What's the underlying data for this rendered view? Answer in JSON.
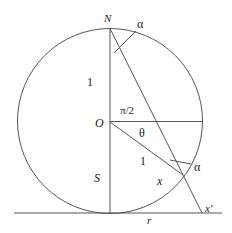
{
  "diagram": {
    "type": "stereographic projection of circle onto line",
    "labels": {
      "north": "N",
      "origin": "O",
      "south": "S",
      "radius_upper": "1",
      "radius_lower": "1",
      "right_angle": "π/2",
      "theta": "θ",
      "alpha_top": "α",
      "alpha_bottom": "α",
      "point_x": "x",
      "point_x_prime": "x'",
      "line_r": "r"
    },
    "colors": {
      "stroke": "#555555",
      "text": "#222222",
      "background": "#ffffff"
    }
  }
}
